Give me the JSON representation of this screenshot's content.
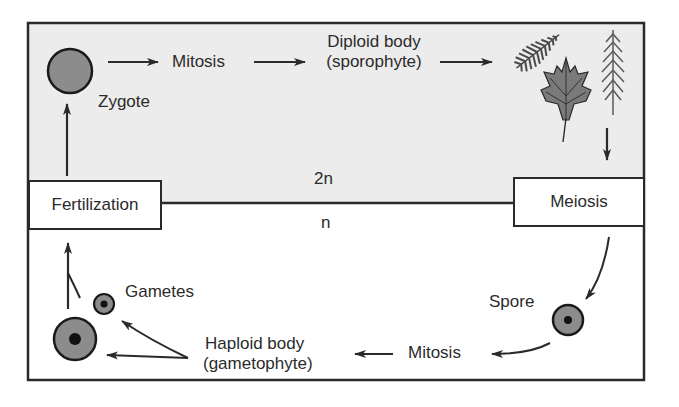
{
  "diagram": {
    "colors": {
      "diploid_region_fill": "#ececec",
      "haploid_region_fill": "#ffffff",
      "border": "#2a2a2a",
      "cell_fill": "#8c8c8c",
      "nucleus": "#111111",
      "plant_fill": "#6e6e6e"
    },
    "regions": {
      "diploid_label": "2n",
      "haploid_label": "n"
    },
    "boxes": {
      "fertilization": "Fertilization",
      "meiosis": "Meiosis"
    },
    "labels": {
      "zygote": "Zygote",
      "mitosis_top": "Mitosis",
      "diploid_body_line1": "Diploid body",
      "diploid_body_line2": "(sporophyte)",
      "spore": "Spore",
      "mitosis_bottom": "Mitosis",
      "haploid_body_line1": "Haploid body",
      "haploid_body_line2": "(gametophyte)",
      "gametes": "Gametes"
    },
    "icons": {
      "zygote": "zygote-cell-icon",
      "sporophyte_plants": [
        "fern-frond-icon",
        "maple-leaf-icon",
        "conifer-branch-icon"
      ],
      "spore": "spore-cell-icon",
      "gametes": [
        "small-gamete-cell-icon",
        "large-gamete-cell-icon"
      ]
    },
    "flow": [
      "Zygote",
      "Mitosis",
      "Diploid body (sporophyte)",
      "Meiosis",
      "Spore",
      "Mitosis",
      "Haploid body (gametophyte)",
      "Gametes",
      "Fertilization",
      "Zygote"
    ]
  }
}
